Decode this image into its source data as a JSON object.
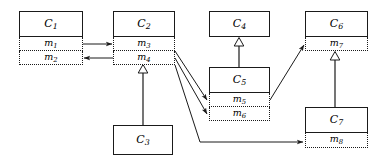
{
  "diagram": {
    "type": "uml-class-method-dependency-diagram",
    "canvas": {
      "width": 381,
      "height": 164
    },
    "stroke_color": "#1a1a1a",
    "background_color": "#ffffff",
    "classes": [
      {
        "id": "C1",
        "name": "C",
        "subscript": "1",
        "x": 19,
        "y": 11,
        "width": 64,
        "height": 26,
        "methods": [
          {
            "id": "m1",
            "name": "m",
            "subscript": "1",
            "height": 14
          },
          {
            "id": "m2",
            "name": "m",
            "subscript": "2",
            "height": 14
          }
        ]
      },
      {
        "id": "C2",
        "name": "C",
        "subscript": "2",
        "x": 113,
        "y": 11,
        "width": 62,
        "height": 26,
        "methods": [
          {
            "id": "m3",
            "name": "m",
            "subscript": "3",
            "height": 14
          },
          {
            "id": "m4",
            "name": "m",
            "subscript": "4",
            "height": 14
          }
        ]
      },
      {
        "id": "C3",
        "name": "C",
        "subscript": "3",
        "x": 113,
        "y": 125,
        "width": 60,
        "height": 30,
        "methods": []
      },
      {
        "id": "C4",
        "name": "C",
        "subscript": "4",
        "x": 209,
        "y": 11,
        "width": 61,
        "height": 26,
        "methods": []
      },
      {
        "id": "C5",
        "name": "C",
        "subscript": "5",
        "x": 209,
        "y": 67,
        "width": 61,
        "height": 26,
        "methods": [
          {
            "id": "m5",
            "name": "m",
            "subscript": "5",
            "height": 14
          },
          {
            "id": "m6",
            "name": "m",
            "subscript": "6",
            "height": 14
          }
        ]
      },
      {
        "id": "C6",
        "name": "C",
        "subscript": "6",
        "x": 305,
        "y": 11,
        "width": 63,
        "height": 26,
        "methods": [
          {
            "id": "m7",
            "name": "m",
            "subscript": "7",
            "height": 14
          }
        ]
      },
      {
        "id": "C7",
        "name": "C",
        "subscript": "7",
        "x": 305,
        "y": 107,
        "width": 63,
        "height": 26,
        "methods": [
          {
            "id": "m8",
            "name": "m",
            "subscript": "8",
            "height": 15
          }
        ]
      }
    ],
    "edges": [
      {
        "id": "e1",
        "from": "m1",
        "to": "m3",
        "kind": "call",
        "arrow": "open"
      },
      {
        "id": "e2",
        "from": "m4",
        "to": "m2",
        "kind": "call",
        "arrow": "open"
      },
      {
        "id": "e3",
        "from": "C3",
        "to": "C2",
        "kind": "inheritance",
        "arrow": "hollow-triangle"
      },
      {
        "id": "e4",
        "from": "C5",
        "to": "C4",
        "kind": "inheritance",
        "arrow": "hollow-triangle"
      },
      {
        "id": "e5",
        "from": "C7",
        "to": "C6",
        "kind": "inheritance",
        "arrow": "hollow-triangle"
      },
      {
        "id": "e6",
        "from": "m3",
        "to": "m5",
        "kind": "call",
        "arrow": "open"
      },
      {
        "id": "e7",
        "from": "m4",
        "to": "m6",
        "kind": "call",
        "arrow": "open"
      },
      {
        "id": "e8",
        "from": "m4",
        "to": "m8",
        "kind": "call",
        "arrow": "open"
      },
      {
        "id": "e9",
        "from": "m5",
        "to": "m7",
        "kind": "call",
        "arrow": "open"
      }
    ]
  }
}
